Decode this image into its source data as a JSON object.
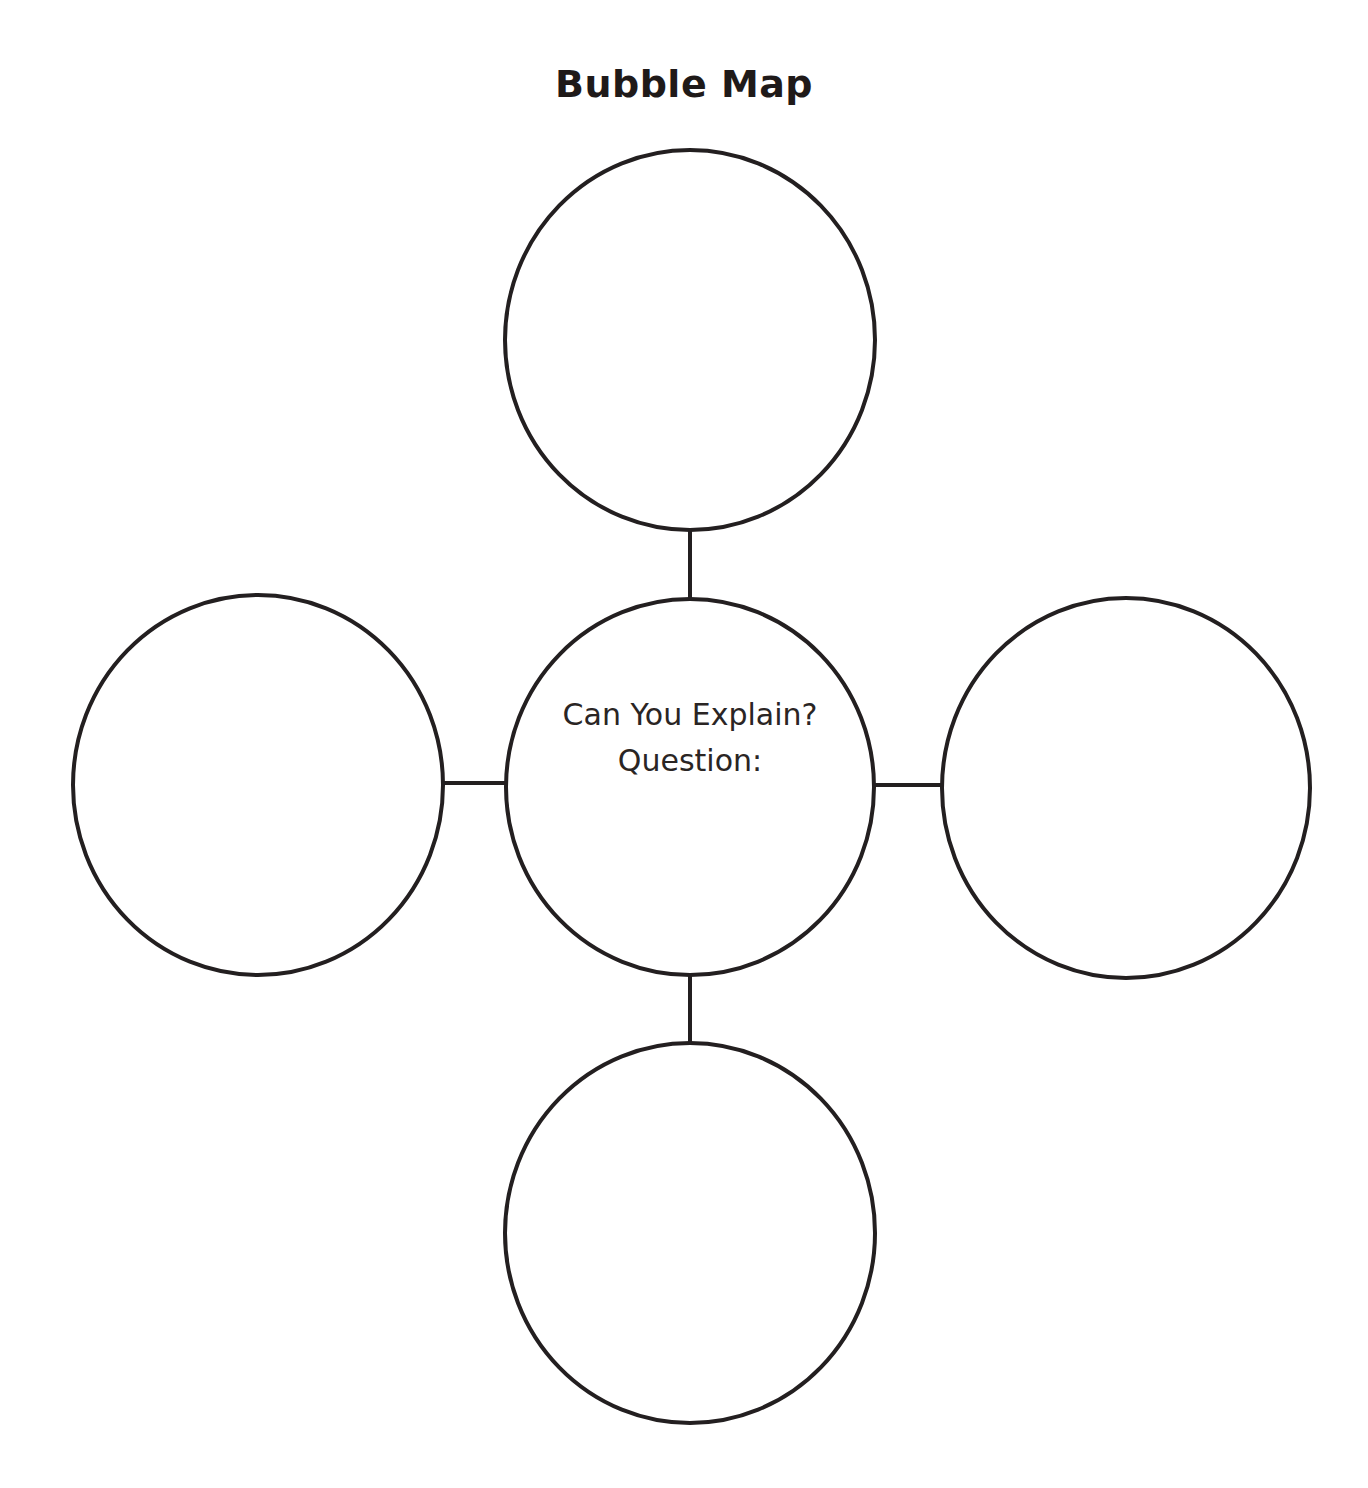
{
  "title": "Bubble Map",
  "center_bubble": {
    "line1": "Can You Explain?",
    "line2": "Question:"
  },
  "outer_bubbles": [
    {
      "position": "top",
      "text": ""
    },
    {
      "position": "left",
      "text": ""
    },
    {
      "position": "right",
      "text": ""
    },
    {
      "position": "bottom",
      "text": ""
    }
  ],
  "colors": {
    "stroke": "#231f20",
    "background": "#ffffff"
  }
}
